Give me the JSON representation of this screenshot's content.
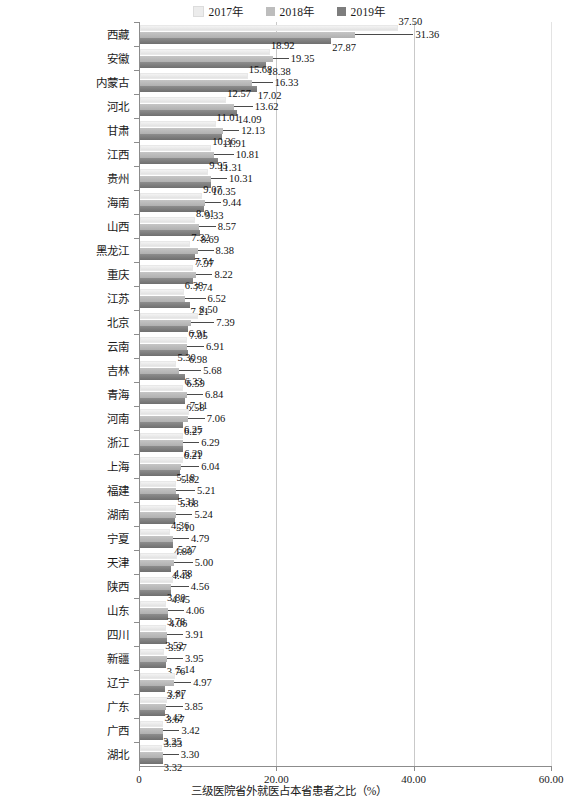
{
  "legend": {
    "position": "top-center",
    "items": [
      {
        "label": "2017年",
        "color": "#ececec"
      },
      {
        "label": "2018年",
        "color": "#bdbdbd"
      },
      {
        "label": "2019年",
        "color": "#7d7d7d"
      }
    ]
  },
  "axis": {
    "x_title": "三级医院省外就医占本省患者之比（%）",
    "x_ticks": [
      "0",
      "20.00",
      "40.00",
      "60.00"
    ],
    "x_tick_values": [
      0,
      20,
      40,
      60
    ]
  },
  "chart_data": {
    "type": "bar",
    "orientation": "horizontal",
    "title": "",
    "xlabel": "三级医院省外就医占本省患者之比（%）",
    "ylabel": "",
    "xlim": [
      0,
      60
    ],
    "grid": true,
    "legend_position": "top-center",
    "categories": [
      "西藏",
      "安徽",
      "内蒙古",
      "河北",
      "甘肃",
      "江西",
      "贵州",
      "海南",
      "山西",
      "黑龙江",
      "重庆",
      "江苏",
      "北京",
      "云南",
      "吉林",
      "青海",
      "河南",
      "浙江",
      "上海",
      "福建",
      "湖南",
      "宁夏",
      "天津",
      "陕西",
      "山东",
      "四川",
      "新疆",
      "辽宁",
      "广东",
      "广西",
      "湖北"
    ],
    "series": [
      {
        "name": "2017年",
        "color": "#ececec",
        "values": [
          37.5,
          18.92,
          15.68,
          12.57,
          11.01,
          10.36,
          9.95,
          9.07,
          8.01,
          7.32,
          7.74,
          6.38,
          8.5,
          6.91,
          5.3,
          6.33,
          7.11,
          6.25,
          6.29,
          5.18,
          5.31,
          4.36,
          5.37,
          4.78,
          3.8,
          3.78,
          3.52,
          5.14,
          3.87,
          3.42,
          3.25
        ]
      },
      {
        "name": "2018年",
        "color": "#bdbdbd",
        "values": [
          31.36,
          19.35,
          16.33,
          13.62,
          12.13,
          10.81,
          10.31,
          9.44,
          8.57,
          8.38,
          8.22,
          6.52,
          7.39,
          6.91,
          5.68,
          6.84,
          7.06,
          6.29,
          6.04,
          5.21,
          5.24,
          4.79,
          5.0,
          4.56,
          4.06,
          3.91,
          3.95,
          4.97,
          3.85,
          3.42,
          3.3
        ]
      },
      {
        "name": "2019年",
        "color": "#7d7d7d",
        "values": [
          27.87,
          18.38,
          17.02,
          14.09,
          11.91,
          11.31,
          10.35,
          9.33,
          8.69,
          7.97,
          7.74,
          7.21,
          7.05,
          6.98,
          6.59,
          6.58,
          6.27,
          6.21,
          5.82,
          5.68,
          5.1,
          4.8,
          4.48,
          4.45,
          4.06,
          3.97,
          3.76,
          3.71,
          3.67,
          3.33,
          3.32
        ]
      }
    ],
    "labels": {
      "西藏": {
        "2017年": "37.50",
        "2018年": "31.36",
        "2019年": "27.87"
      },
      "安徽": {
        "2017年": "18.92",
        "2018年": "19.35",
        "2019年": "18.38"
      },
      "内蒙古": {
        "2017年": "15.68",
        "2018年": "16.33",
        "2019年": "17.02"
      },
      "河北": {
        "2017年": "12.57",
        "2018年": "13.62",
        "2019年": "14.09"
      },
      "甘肃": {
        "2017年": "11.01",
        "2018年": "12.13",
        "2019年": "11.91"
      },
      "江西": {
        "2017年": "10.36",
        "2018年": "10.81",
        "2019年": "11.31"
      },
      "贵州": {
        "2017年": "9.95",
        "2018年": "10.31",
        "2019年": "10.35"
      },
      "海南": {
        "2017年": "9.07",
        "2018年": "9.44",
        "2019年": "9.33"
      },
      "山西": {
        "2017年": "8.01",
        "2018年": "8.57",
        "2019年": "8.69"
      },
      "黑龙江": {
        "2017年": "7.32",
        "2018年": "8.38",
        "2019年": "7.97"
      },
      "重庆": {
        "2017年": "7.74",
        "2018年": "8.22",
        "2019年": "7.74"
      },
      "江苏": {
        "2017年": "6.38",
        "2018年": "6.52",
        "2019年": "7.21"
      },
      "北京": {
        "2017年": "8.50",
        "2018年": "7.39",
        "2019年": "7.05"
      },
      "云南": {
        "2017年": "6.91",
        "2018年": "6.91",
        "2019年": "6.98"
      },
      "吉林": {
        "2017年": "5.30",
        "2018年": "5.68",
        "2019年": "6.59"
      },
      "青海": {
        "2017年": "6.33",
        "2018年": "6.84",
        "2019年": "6.58"
      },
      "河南": {
        "2017年": "7.11",
        "2018年": "7.06",
        "2019年": "6.27"
      },
      "浙江": {
        "2017年": "6.25",
        "2018年": "6.29",
        "2019年": "6.21"
      },
      "上海": {
        "2017年": "6.29",
        "2018年": "6.04",
        "2019年": "5.82"
      },
      "福建": {
        "2017年": "5.18",
        "2018年": "5.21",
        "2019年": "5.68"
      },
      "湖南": {
        "2017年": "5.31",
        "2018年": "5.24",
        "2019年": "5.10"
      },
      "宁夏": {
        "2017年": "4.36",
        "2018年": "4.79",
        "2019年": "4.80"
      },
      "天津": {
        "2017年": "5.37",
        "2018年": "5.00",
        "2019年": "4.48"
      },
      "陕西": {
        "2017年": "4.78",
        "2018年": "4.56",
        "2019年": "4.45"
      },
      "山东": {
        "2017年": "3.80",
        "2018年": "4.06",
        "2019年": "4.06"
      },
      "四川": {
        "2017年": "3.78",
        "2018年": "3.91",
        "2019年": "3.97"
      },
      "新疆": {
        "2017年": "3.52",
        "2018年": "3.95",
        "2019年": "3.76"
      },
      "辽宁": {
        "2017年": "5.14",
        "2018年": "4.97",
        "2019年": "3.71"
      },
      "广东": {
        "2017年": "3.87",
        "2018年": "3.85",
        "2019年": "3.67"
      },
      "广西": {
        "2017年": "3.42",
        "2018年": "3.42",
        "2019年": "3.33"
      },
      "湖北": {
        "2017年": "3.25",
        "2018年": "3.30",
        "2019年": "3.32"
      }
    }
  }
}
